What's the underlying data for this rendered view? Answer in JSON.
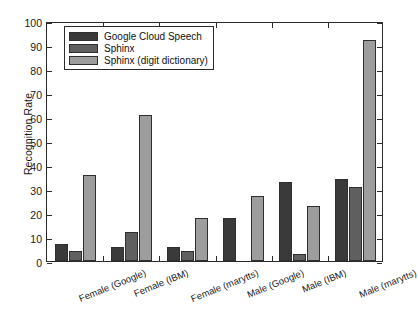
{
  "chart_data": {
    "type": "bar",
    "title": "",
    "xlabel": "",
    "ylabel": "Recognition Rate",
    "ylim": [
      0,
      100
    ],
    "ytick_step": 10,
    "yticks": [
      0,
      10,
      20,
      30,
      40,
      50,
      60,
      70,
      80,
      90,
      100
    ],
    "grid": false,
    "legend_position": "upper left",
    "categories": [
      "Female (Google)",
      "Female (IBM)",
      "Female (marytts)",
      "Male (Google)",
      "Male (IBM)",
      "Male (marytts)"
    ],
    "series": [
      {
        "name": "Google Cloud Speech",
        "color": "#3a3a3a",
        "values": [
          7,
          6,
          6,
          18,
          33,
          34
        ]
      },
      {
        "name": "Sphinx",
        "color": "#5f5f5f",
        "values": [
          4,
          12,
          4,
          0,
          3,
          31
        ]
      },
      {
        "name": "Sphinx (digit dictionary)",
        "color": "#9d9d9d",
        "values": [
          36,
          61,
          18,
          27,
          23,
          92
        ]
      }
    ]
  },
  "axes": {
    "y_axis_label": "Recognition Rate",
    "y_tick_labels": [
      "0",
      "10",
      "20",
      "30",
      "40",
      "50",
      "60",
      "70",
      "80",
      "90",
      "100"
    ]
  },
  "legend": {
    "items": [
      {
        "label": "Google Cloud Speech",
        "color": "#3a3a3a"
      },
      {
        "label": "Sphinx",
        "color": "#5f5f5f"
      },
      {
        "label": "Sphinx (digit dictionary)",
        "color": "#9d9d9d"
      }
    ]
  }
}
